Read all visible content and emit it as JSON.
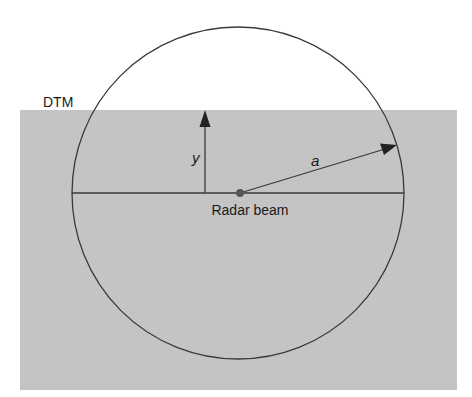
{
  "diagram": {
    "title_label": "DTM",
    "vertical_label": "y",
    "radius_label": "a",
    "center_label": "Radar beam",
    "colors": {
      "background": "#ffffff",
      "terrain_fill": "#c4c4c4",
      "stroke": "#3a3a3a",
      "center_dot": "#555555"
    }
  }
}
